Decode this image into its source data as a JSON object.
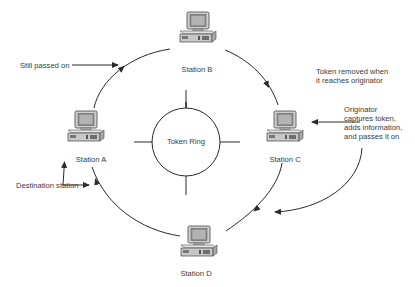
{
  "diagram": {
    "type": "token-ring-network",
    "center": {
      "label": "Token Ring"
    },
    "stations": [
      {
        "id": "A",
        "label": "Station A",
        "role": "destination"
      },
      {
        "id": "B",
        "label": "Station B",
        "role": "passes token"
      },
      {
        "id": "C",
        "label": "Station C",
        "role": "originator"
      },
      {
        "id": "D",
        "label": "Station D",
        "role": "passes token"
      }
    ],
    "flow": [
      "C",
      "D",
      "A",
      "B",
      "C"
    ],
    "annotations": {
      "still_passed_on": "Still passed on",
      "token_removed_line1": "Token removed when",
      "token_removed_line2": "it reaches originator",
      "originator_line1": "Originator",
      "originator_line2": "captures token,",
      "originator_line3": "adds information,",
      "originator_line4": "and passes it on",
      "destination": "Destination station"
    },
    "colors": {
      "line": "#2a2a2a",
      "text": "#3a3a3a",
      "screen": "#9a9a9a",
      "case": "#d8d8d8"
    }
  }
}
